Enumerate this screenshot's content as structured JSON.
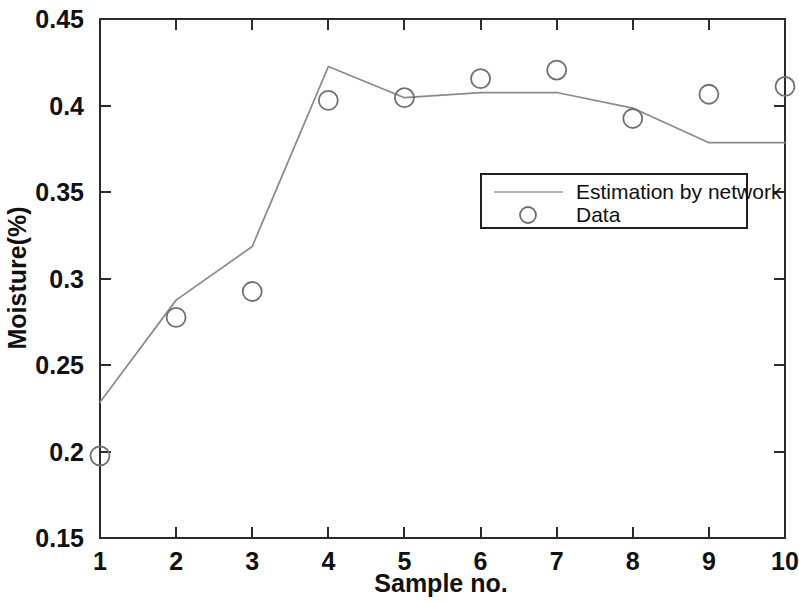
{
  "chart_data": {
    "type": "line",
    "title": "",
    "xlabel": "Sample no.",
    "ylabel": "Moisture(%)",
    "x": [
      1,
      2,
      3,
      4,
      5,
      6,
      7,
      8,
      9,
      10
    ],
    "xtick_labels": [
      "1",
      "2",
      "3",
      "4",
      "5",
      "6",
      "7",
      "8",
      "9",
      "10"
    ],
    "ytick_labels": [
      "0.15",
      "0.2",
      "0.25",
      "0.3",
      "0.35",
      "0.4",
      "0.45"
    ],
    "ytick_values": [
      0.15,
      0.2,
      0.25,
      0.3,
      0.35,
      0.4,
      0.45
    ],
    "xlim": [
      1,
      10
    ],
    "ylim": [
      0.15,
      0.45
    ],
    "grid": false,
    "legend_position": "center-right",
    "series": [
      {
        "name": "Estimation by network",
        "style": "line",
        "color": "#8a8a8a",
        "values": [
          0.2285,
          0.2875,
          0.3185,
          0.4225,
          0.4045,
          0.4075,
          0.4075,
          0.3985,
          0.3785,
          0.3785
        ]
      },
      {
        "name": "Data",
        "style": "marker-circle",
        "color": "#707070",
        "values": [
          0.1975,
          0.2775,
          0.2925,
          0.403,
          0.4045,
          0.4155,
          0.4205,
          0.3925,
          0.4065,
          0.411
        ]
      }
    ]
  },
  "legend": {
    "entries": [
      {
        "label": "Estimation by network",
        "marker": "line"
      },
      {
        "label": "Data",
        "marker": "circle"
      }
    ]
  }
}
